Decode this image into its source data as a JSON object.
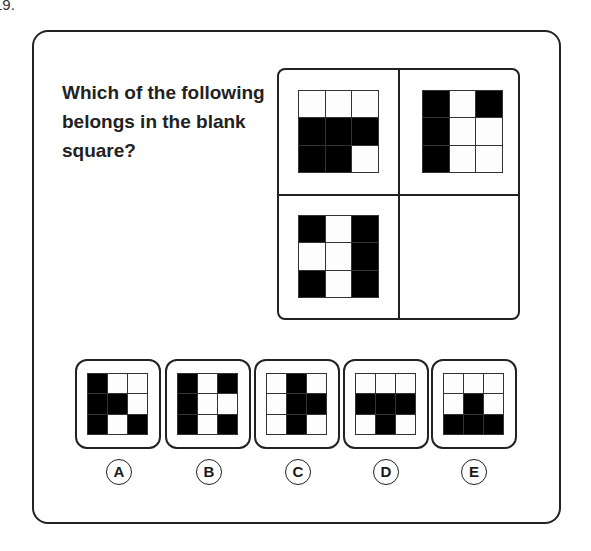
{
  "question_number": "19.",
  "question": "Which of the following belongs in the blank square?",
  "matrix": {
    "top_left": [
      [
        0,
        0,
        0
      ],
      [
        1,
        1,
        1
      ],
      [
        1,
        1,
        0
      ]
    ],
    "top_right": [
      [
        1,
        0,
        1
      ],
      [
        1,
        0,
        0
      ],
      [
        1,
        0,
        0
      ]
    ],
    "bottom_left": [
      [
        1,
        0,
        1
      ],
      [
        0,
        0,
        1
      ],
      [
        1,
        0,
        1
      ]
    ],
    "bottom_right": null
  },
  "options": [
    {
      "label": "A",
      "pattern": [
        [
          1,
          0,
          0
        ],
        [
          1,
          1,
          0
        ],
        [
          1,
          0,
          1
        ]
      ]
    },
    {
      "label": "B",
      "pattern": [
        [
          1,
          0,
          1
        ],
        [
          1,
          0,
          0
        ],
        [
          1,
          0,
          1
        ]
      ]
    },
    {
      "label": "C",
      "pattern": [
        [
          0,
          1,
          0
        ],
        [
          0,
          1,
          1
        ],
        [
          0,
          1,
          0
        ]
      ]
    },
    {
      "label": "D",
      "pattern": [
        [
          0,
          0,
          0
        ],
        [
          1,
          1,
          1
        ],
        [
          0,
          1,
          0
        ]
      ]
    },
    {
      "label": "E",
      "pattern": [
        [
          0,
          0,
          0
        ],
        [
          0,
          1,
          0
        ],
        [
          1,
          1,
          1
        ]
      ]
    }
  ],
  "colors": {
    "filled": "#000000",
    "empty": "#fdfdfd",
    "border": "#222222"
  }
}
